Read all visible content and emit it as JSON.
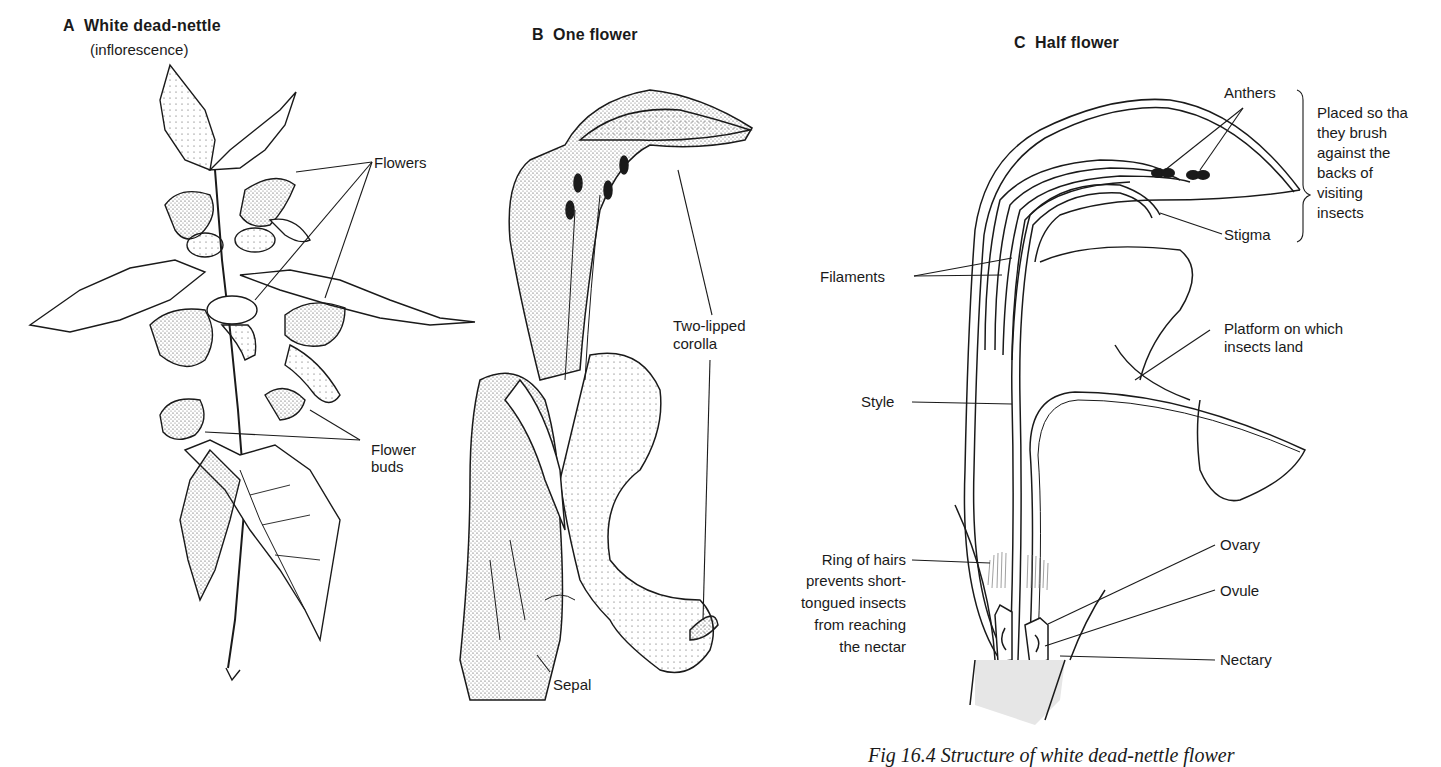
{
  "figure": {
    "caption": "Fig 16.4  Structure of white dead-nettle flower"
  },
  "panels": [
    {
      "id": "A",
      "letter": "A",
      "title": "White dead-nettle",
      "subtitle": "(inflorescence)",
      "labels": [
        "Flowers",
        "Flower",
        "buds"
      ]
    },
    {
      "id": "B",
      "letter": "B",
      "title": "One flower",
      "labels": [
        "Two-lipped",
        "corolla",
        "Sepal"
      ]
    },
    {
      "id": "C",
      "letter": "C",
      "title": "Half flower",
      "labels": {
        "anthers": "Anthers",
        "stigma": "Stigma",
        "brace_note": [
          "Placed so tha",
          "they brush",
          "against the",
          "backs of",
          "visiting",
          "insects"
        ],
        "filaments": "Filaments",
        "platform": [
          "Platform on which",
          "insects land"
        ],
        "style": "Style",
        "ring_of_hairs": [
          "Ring of hairs",
          "prevents short-",
          "tongued insects",
          "from reaching",
          "the nectar"
        ],
        "ovary": "Ovary",
        "ovule": "Ovule",
        "nectary": "Nectary"
      }
    }
  ],
  "colors": {
    "ink": "#1a1a1a",
    "tissue_fill": "#e6e6e6",
    "background": "#ffffff"
  }
}
